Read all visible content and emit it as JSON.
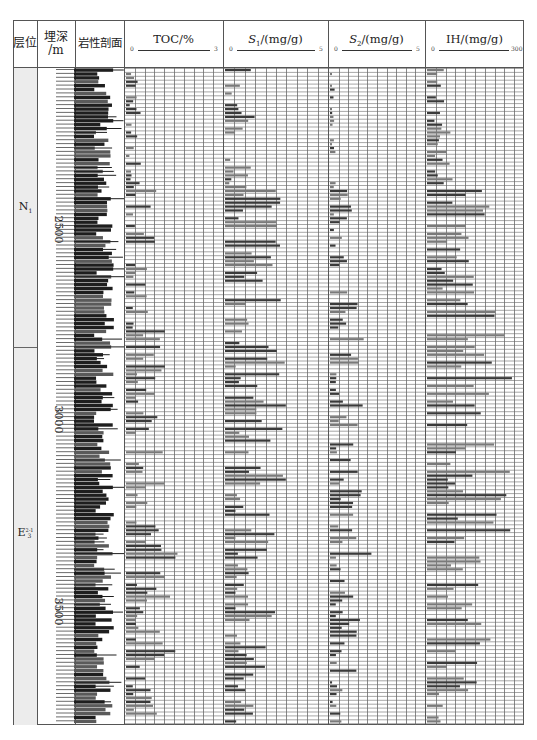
{
  "chart_data": {
    "type": "bar",
    "title": "",
    "orientation": "horizontal-bars-vs-depth",
    "columns": [
      "层位",
      "埋深/m",
      "岩性剖面",
      "TOC/%",
      "S1/(mg/g)",
      "S2/(mg/g)",
      "IH/(mg/g)"
    ],
    "depth_axis": {
      "label": "埋深/m",
      "ticks": [
        2500,
        3000,
        3500
      ],
      "range": [
        2200,
        3720
      ]
    },
    "strata": [
      {
        "label": "N1",
        "depth_range": [
          2200,
          2800
        ]
      },
      {
        "label": "E3 2-1",
        "depth_range": [
          2800,
          3720
        ]
      }
    ],
    "tracks": [
      {
        "name": "TOC",
        "unit": "%",
        "xlim": [
          0,
          3
        ],
        "grid_divisions": 10
      },
      {
        "name": "S1",
        "unit": "mg/g",
        "xlim": [
          0,
          5
        ],
        "grid_divisions": 10
      },
      {
        "name": "S2",
        "unit": "mg/g",
        "xlim": [
          0,
          5
        ],
        "grid_divisions": 10
      },
      {
        "name": "IH",
        "unit": "mg/g",
        "xlim": [
          0,
          300
        ],
        "grid_divisions": 10
      }
    ],
    "series_profile": [
      {
        "depth_zone": "2200-2480",
        "TOC": [
          0.1,
          0.5
        ],
        "S1": [
          0.2,
          1.5
        ],
        "S2": [
          0.1,
          0.3
        ],
        "IH": [
          20,
          80
        ]
      },
      {
        "depth_zone": "2480-2800",
        "TOC": [
          0.2,
          1.0
        ],
        "S1": [
          0.5,
          3.2
        ],
        "S2": [
          0.2,
          1.5
        ],
        "IH": [
          40,
          220
        ]
      },
      {
        "depth_zone": "2800-3300",
        "TOC": [
          0.3,
          1.2
        ],
        "S1": [
          0.5,
          3.0
        ],
        "S2": [
          0.3,
          1.8
        ],
        "IH": [
          60,
          260
        ]
      },
      {
        "depth_zone": "3300-3600",
        "TOC": [
          0.3,
          1.6
        ],
        "S1": [
          0.5,
          2.8
        ],
        "S2": [
          0.3,
          2.2
        ],
        "IH": [
          60,
          240
        ]
      },
      {
        "depth_zone": "3600-3720",
        "TOC": [
          0.2,
          1.0
        ],
        "S1": [
          0.3,
          1.5
        ],
        "S2": [
          0.1,
          0.8
        ],
        "IH": [
          30,
          160
        ]
      }
    ],
    "grid": true,
    "legend": "none"
  },
  "header": {
    "stratum": "层位",
    "depth_line1": "埋深",
    "depth_line2": "/m",
    "lithology": "岩性剖面",
    "toc": {
      "title": "TOC/%",
      "min": "0",
      "max": "3"
    },
    "s1": {
      "title_var": "S",
      "title_sub": "1",
      "title_unit": "/(mg/g)",
      "min": "0",
      "max": "5"
    },
    "s2": {
      "title_var": "S",
      "title_sub": "2",
      "title_unit": "/(mg/g)",
      "min": "0",
      "max": "5"
    },
    "ih": {
      "title": "IH/(mg/g)",
      "min": "0",
      "max": "300"
    }
  },
  "strata_labels": {
    "n1_main": "N",
    "n1_sub": "1",
    "e3_main": "E",
    "e3_sup": "2-1",
    "e3_sub": "3"
  },
  "depth_ticks": [
    "2500",
    "3000",
    "3500"
  ],
  "colors": {
    "frame": "#555555",
    "grid": "#6a6a6a",
    "bar_dark": "#3a3a3a",
    "bar_mid": "#7a7a7a",
    "strata_fill": "#ececec",
    "lithology_dark": "#1e1e1e",
    "lithology_mid": "#5a5a5a"
  }
}
